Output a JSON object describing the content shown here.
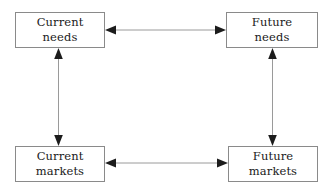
{
  "diagram": {
    "background_color": "#ffffff",
    "box_border_color": "#8a8a8a",
    "line_color": "#9a9a9a",
    "arrowhead_color": "#1c1c1c",
    "text_color": "#1a1a1a",
    "nodes": [
      {
        "id": "current-needs",
        "line1": "Current",
        "line2": "needs",
        "position": "top-left"
      },
      {
        "id": "future-needs",
        "line1": "Future",
        "line2": "needs",
        "position": "top-right"
      },
      {
        "id": "current-markets",
        "line1": "Current",
        "line2": "markets",
        "position": "bottom-left"
      },
      {
        "id": "future-markets",
        "line1": "Future",
        "line2": "markets",
        "position": "bottom-right"
      }
    ],
    "connectors": [
      {
        "id": "needs-horizontal",
        "from": "current-needs",
        "to": "future-needs",
        "orientation": "horizontal",
        "arrowheads": "both"
      },
      {
        "id": "markets-horizontal",
        "from": "current-markets",
        "to": "future-markets",
        "orientation": "horizontal",
        "arrowheads": "both"
      },
      {
        "id": "current-vertical",
        "from": "current-needs",
        "to": "current-markets",
        "orientation": "vertical",
        "arrowheads": "both"
      },
      {
        "id": "future-vertical",
        "from": "future-needs",
        "to": "future-markets",
        "orientation": "vertical",
        "arrowheads": "both"
      }
    ]
  }
}
